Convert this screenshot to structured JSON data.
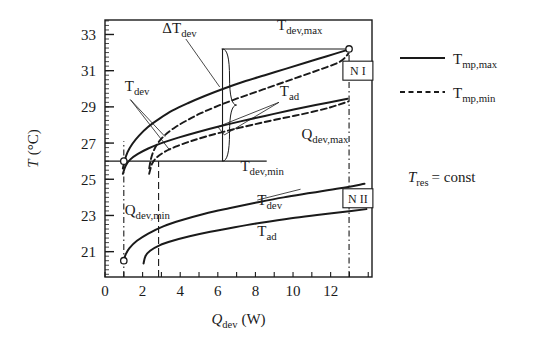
{
  "chart_data": {
    "type": "line",
    "title": "",
    "xlabel": "Q_dev (W)",
    "ylabel": "T (°C)",
    "xlim": [
      0,
      14.2
    ],
    "ylim": [
      19.6,
      33.8
    ],
    "grid": false,
    "legend_position": "right",
    "x_ticks": [
      0,
      2,
      4,
      6,
      8,
      10,
      12
    ],
    "x_tick_labels": [
      "0",
      "2",
      "4",
      "6",
      "8",
      "10",
      "12"
    ],
    "x_minor_step": 1,
    "y_ticks": [
      21,
      23,
      25,
      27,
      29,
      31,
      33
    ],
    "y_tick_labels": [
      "21",
      "23",
      "25",
      "27",
      "29",
      "31",
      "33"
    ],
    "y_minor_step": 0.25,
    "series": [
      {
        "name": "T_dev max (group N I)",
        "style": "solid",
        "points": [
          [
            0.95,
            25.6
          ],
          [
            1.05,
            26.05
          ],
          [
            1.2,
            26.5
          ],
          [
            1.45,
            26.95
          ],
          [
            1.8,
            27.4
          ],
          [
            2.3,
            27.9
          ],
          [
            2.9,
            28.35
          ],
          [
            3.6,
            28.8
          ],
          [
            4.4,
            29.2
          ],
          [
            5.3,
            29.6
          ],
          [
            6.3,
            30.0
          ],
          [
            7.4,
            30.4
          ],
          [
            8.5,
            30.75
          ],
          [
            9.6,
            31.1
          ],
          [
            10.7,
            31.45
          ],
          [
            11.8,
            31.8
          ],
          [
            12.9,
            32.15
          ]
        ]
      },
      {
        "name": "T_dev min (group N I)",
        "style": "dashed",
        "points": [
          [
            2.35,
            25.6
          ],
          [
            2.45,
            26.15
          ],
          [
            2.6,
            26.6
          ],
          [
            2.85,
            27.05
          ],
          [
            3.2,
            27.45
          ],
          [
            3.7,
            27.85
          ],
          [
            4.35,
            28.25
          ],
          [
            5.1,
            28.65
          ],
          [
            6.0,
            29.05
          ],
          [
            7.0,
            29.45
          ],
          [
            8.1,
            29.85
          ],
          [
            9.2,
            30.25
          ],
          [
            10.3,
            30.65
          ],
          [
            11.4,
            31.05
          ],
          [
            12.5,
            31.5
          ],
          [
            12.95,
            31.95
          ]
        ]
      },
      {
        "name": "T_ad max (group N I)",
        "style": "solid",
        "points": [
          [
            0.95,
            25.3
          ],
          [
            1.1,
            25.75
          ],
          [
            1.35,
            26.1
          ],
          [
            1.75,
            26.4
          ],
          [
            2.3,
            26.7
          ],
          [
            3.0,
            27.0
          ],
          [
            3.9,
            27.3
          ],
          [
            4.9,
            27.6
          ],
          [
            6.0,
            27.9
          ],
          [
            7.2,
            28.2
          ],
          [
            8.5,
            28.5
          ],
          [
            9.8,
            28.8
          ],
          [
            11.2,
            29.1
          ],
          [
            12.9,
            29.45
          ]
        ]
      },
      {
        "name": "T_ad min (group N I)",
        "style": "dashed",
        "points": [
          [
            2.35,
            25.3
          ],
          [
            2.5,
            25.85
          ],
          [
            2.75,
            26.2
          ],
          [
            3.15,
            26.5
          ],
          [
            3.75,
            26.8
          ],
          [
            4.55,
            27.1
          ],
          [
            5.5,
            27.4
          ],
          [
            6.6,
            27.7
          ],
          [
            7.8,
            28.0
          ],
          [
            9.1,
            28.3
          ],
          [
            10.5,
            28.6
          ],
          [
            11.9,
            28.95
          ],
          [
            12.95,
            29.3
          ]
        ]
      },
      {
        "name": "T_dev (group N II)",
        "style": "solid",
        "points": [
          [
            1.0,
            20.5
          ],
          [
            1.1,
            20.85
          ],
          [
            1.3,
            21.2
          ],
          [
            1.7,
            21.6
          ],
          [
            2.3,
            22.0
          ],
          [
            3.1,
            22.4
          ],
          [
            4.1,
            22.75
          ],
          [
            5.3,
            23.1
          ],
          [
            6.6,
            23.4
          ],
          [
            8.0,
            23.7
          ],
          [
            9.5,
            24.0
          ],
          [
            11.0,
            24.25
          ],
          [
            12.5,
            24.5
          ],
          [
            13.8,
            24.75
          ]
        ]
      },
      {
        "name": "T_ad (group N II)",
        "style": "solid",
        "points": [
          [
            2.05,
            20.35
          ],
          [
            2.15,
            20.75
          ],
          [
            2.4,
            21.05
          ],
          [
            2.9,
            21.35
          ],
          [
            3.6,
            21.6
          ],
          [
            4.5,
            21.85
          ],
          [
            5.6,
            22.1
          ],
          [
            6.9,
            22.35
          ],
          [
            8.3,
            22.6
          ],
          [
            9.9,
            22.85
          ],
          [
            11.5,
            23.05
          ],
          [
            13.1,
            23.25
          ],
          [
            13.9,
            23.35
          ]
        ]
      }
    ],
    "markers": [
      {
        "name": "q-dev-min-marker-ni",
        "x": 1.0,
        "y": 26.0
      },
      {
        "name": "q-dev-max-marker-ni",
        "x": 12.98,
        "y": 32.2
      },
      {
        "name": "q-dev-min-marker-nii",
        "x": 1.0,
        "y": 20.5
      }
    ],
    "reference_lines": [
      {
        "name": "q-dev-min-line",
        "orientation": "vertical",
        "value": 1.0,
        "style": "dashdot",
        "from": 19.6,
        "to": 27.1
      },
      {
        "name": "q-dev-min-dashed-line",
        "orientation": "vertical",
        "value": 2.85,
        "style": "dashed",
        "from": 19.6,
        "to": 26.0
      },
      {
        "name": "q-dev-max-line",
        "orientation": "vertical",
        "value": 12.98,
        "style": "dashdot",
        "from": 19.6,
        "to": 32.2
      },
      {
        "name": "t-dev-max-line",
        "orientation": "horizontal",
        "value": 32.2,
        "style": "solid",
        "from": 6.2,
        "to": 12.98
      },
      {
        "name": "t-dev-min-line",
        "orientation": "horizontal",
        "value": 26.0,
        "style": "solid",
        "from": 0.0,
        "to": 8.6
      },
      {
        "name": "delta-t-dev-connector",
        "orientation": "vertical",
        "value": 6.25,
        "style": "solid",
        "from": 26.0,
        "to": 32.2
      }
    ],
    "annotations": [
      {
        "name": "delta-t-dev-label",
        "text": "ΔT_dev",
        "x": 3.05,
        "y": 33.1
      },
      {
        "name": "t-dev-max-label",
        "text": "T_dev,max",
        "x": 9.15,
        "y": 33.25
      },
      {
        "name": "t-dev-label-upper",
        "text": "T_dev",
        "x": 1.05,
        "y": 29.9
      },
      {
        "name": "t-ad-label-upper",
        "text": "T_ad",
        "x": 9.3,
        "y": 29.6
      },
      {
        "name": "t-dev-min-label",
        "text": "T_dev,min",
        "x": 7.2,
        "y": 25.45
      },
      {
        "name": "q-dev-max-label",
        "text": "Q_dev,max",
        "x": 10.45,
        "y": 27.2
      },
      {
        "name": "q-dev-min-label",
        "text": "Q_dev,min",
        "x": 1.05,
        "y": 23.05
      },
      {
        "name": "t-dev-label-lower",
        "text": "T_dev",
        "x": 8.1,
        "y": 23.6
      },
      {
        "name": "t-ad-label-lower",
        "text": "T_ad",
        "x": 8.1,
        "y": 21.85
      }
    ],
    "group_boxes": [
      {
        "name": "group-box-n1",
        "text": "N I",
        "x": 13.45,
        "y": 31.0
      },
      {
        "name": "group-box-n2",
        "text": "N II",
        "x": 13.45,
        "y": 23.95
      }
    ],
    "legend": [
      {
        "name": "legend-tmp-max",
        "label": "T_mp,max",
        "style": "solid"
      },
      {
        "name": "legend-tmp-min",
        "label": "T_mp,min",
        "style": "dashed"
      }
    ],
    "side_note": "T_res = const"
  },
  "axis": {
    "y_title_main": "T",
    "y_title_unit": "(°C)",
    "x_title_main": "Q",
    "x_title_sub": "dev",
    "x_title_unit": "(W)"
  }
}
